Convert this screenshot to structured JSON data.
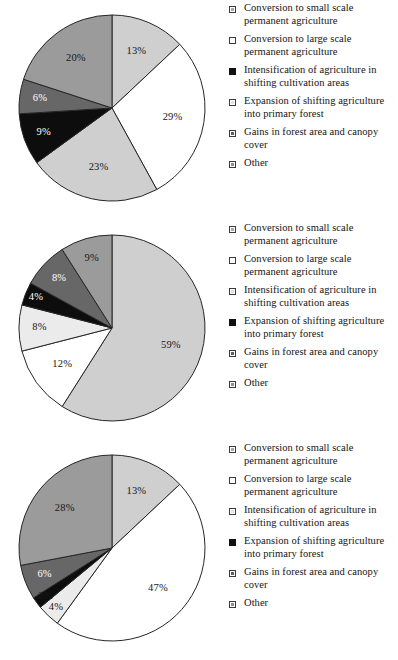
{
  "figure": {
    "title": "",
    "panel_count": 3
  },
  "legend_entries": [
    "Conversion to small scale permanent agriculture",
    "Conversion to large scale permanent agriculture",
    "Intensification of agriculture in shifting cultivation areas",
    "Expansion of shifting agriculture into primary forest",
    "Gains in forest area and canopy cover",
    "Other"
  ],
  "swatch_styles": {
    "light_grey": "m-lightgrey",
    "white": "m-white",
    "very_light_grey": "m-verylight",
    "black": "m-black",
    "dark_grey": "m-darkgrey",
    "mid_grey": "m-midgrey"
  },
  "colors": {
    "light_grey": "#cfcfcf",
    "white": "#ffffff",
    "very_light_grey": "#ebebeb",
    "black": "#0d0d0d",
    "dark_grey": "#676767",
    "mid_grey": "#9b9b9b",
    "outline": "#262626",
    "label_dark": "#171717",
    "label_light": "#ffffff",
    "background": "#ffffff"
  },
  "chart_data": [
    {
      "type": "pie",
      "title": "",
      "index": 0,
      "start_angle_deg": 0,
      "direction": "clockwise",
      "categories": [
        "Conversion to small scale permanent agriculture",
        "Conversion to large scale permanent agriculture",
        "Intensification of agriculture in shifting cultivation areas",
        "Expansion of shifting agriculture into primary forest",
        "Gains in forest area and canopy cover",
        "Other"
      ],
      "values": [
        13,
        29,
        23,
        9,
        6,
        20
      ],
      "labels": [
        "13%",
        "29%",
        "23%",
        "9%",
        "6%",
        "20%"
      ],
      "slice_fills": [
        "light_grey",
        "white",
        "light_grey",
        "black",
        "dark_grey",
        "mid_grey"
      ],
      "label_colors": [
        "dark",
        "dark",
        "dark",
        "light",
        "light",
        "dark"
      ],
      "legend_marker_styles": [
        "light_grey",
        "white",
        "black",
        "very_light_grey",
        "dark_grey",
        "mid_grey"
      ]
    },
    {
      "type": "pie",
      "title": "",
      "index": 1,
      "start_angle_deg": 0,
      "direction": "clockwise",
      "categories": [
        "Conversion to small scale permanent agriculture",
        "Conversion to large scale permanent agriculture",
        "Intensification of agriculture in shifting cultivation areas",
        "Expansion of shifting agriculture into primary forest",
        "Gains in forest area and canopy cover",
        "Other"
      ],
      "values": [
        59,
        12,
        8,
        4,
        8,
        9
      ],
      "labels": [
        "59%",
        "12%",
        "8%",
        "4%",
        "8%",
        "9%"
      ],
      "slice_fills": [
        "light_grey",
        "white",
        "very_light_grey",
        "black",
        "dark_grey",
        "mid_grey"
      ],
      "label_colors": [
        "dark",
        "dark",
        "dark",
        "light",
        "light",
        "dark"
      ],
      "legend_marker_styles": [
        "light_grey",
        "white",
        "very_light_grey",
        "black",
        "dark_grey",
        "mid_grey"
      ]
    },
    {
      "type": "pie",
      "title": "",
      "index": 2,
      "start_angle_deg": 0,
      "direction": "clockwise",
      "categories": [
        "Conversion to small scale permanent agriculture",
        "Conversion to large scale permanent agriculture",
        "Intensification of agriculture in shifting cultivation areas",
        "Expansion of shifting agriculture into primary forest",
        "Gains in forest area and canopy cover",
        "Other"
      ],
      "values": [
        13,
        47,
        4,
        2,
        6,
        28
      ],
      "labels": [
        "13%",
        "47%",
        "4%",
        "2%",
        "6%",
        "28%"
      ],
      "slice_fills": [
        "light_grey",
        "white",
        "very_light_grey",
        "black",
        "dark_grey",
        "mid_grey"
      ],
      "label_colors": [
        "dark",
        "dark",
        "dark",
        "dark",
        "light",
        "dark"
      ],
      "legend_marker_styles": [
        "light_grey",
        "white",
        "very_light_grey",
        "black",
        "dark_grey",
        "mid_grey"
      ]
    }
  ]
}
